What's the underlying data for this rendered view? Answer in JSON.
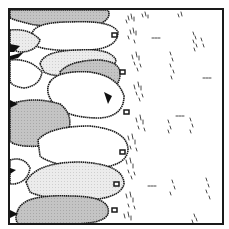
{
  "map": {
    "title": "Forest edge map tile",
    "frame": {
      "x": 9,
      "y": 9,
      "width": 214,
      "height": 215,
      "stroke": "#1a1a1a"
    },
    "colors": {
      "background": "#ffffff",
      "canopy_gray": "#bdbdbd",
      "canopy_light": "#e6e6e6",
      "canopy_white": "#ffffff",
      "outline": "#1a1a1a",
      "grass": "#333333",
      "shadow": "#111111"
    },
    "regions": [
      {
        "name": "tree-canopy",
        "side": "left",
        "count": 12
      },
      {
        "name": "grass-field",
        "side": "right"
      }
    ],
    "trees": [
      {
        "cx": 60,
        "cy": 14,
        "rx": 52,
        "ry": 12,
        "fill": "canopy_gray"
      },
      {
        "cx": 85,
        "cy": 37,
        "rx": 52,
        "ry": 16,
        "fill": "canopy_white"
      },
      {
        "cx": 45,
        "cy": 52,
        "rx": 35,
        "ry": 14,
        "fill": "canopy_light"
      },
      {
        "cx": 95,
        "cy": 80,
        "rx": 35,
        "ry": 17,
        "fill": "canopy_white"
      },
      {
        "cx": 60,
        "cy": 68,
        "rx": 40,
        "ry": 14,
        "fill": "canopy_light"
      },
      {
        "cx": 90,
        "cy": 82,
        "rx": 30,
        "ry": 15,
        "fill": "canopy_gray"
      },
      {
        "cx": 97,
        "cy": 113,
        "rx": 33,
        "ry": 22,
        "fill": "canopy_white"
      },
      {
        "cx": 40,
        "cy": 125,
        "rx": 32,
        "ry": 24,
        "fill": "canopy_gray"
      },
      {
        "cx": 80,
        "cy": 148,
        "rx": 50,
        "ry": 22,
        "fill": "canopy_white"
      },
      {
        "cx": 70,
        "cy": 180,
        "rx": 55,
        "ry": 24,
        "fill": "canopy_light"
      },
      {
        "cx": 60,
        "cy": 208,
        "rx": 48,
        "ry": 18,
        "fill": "canopy_gray"
      },
      {
        "cx": 25,
        "cy": 175,
        "rx": 18,
        "ry": 14,
        "fill": "canopy_white"
      }
    ]
  }
}
